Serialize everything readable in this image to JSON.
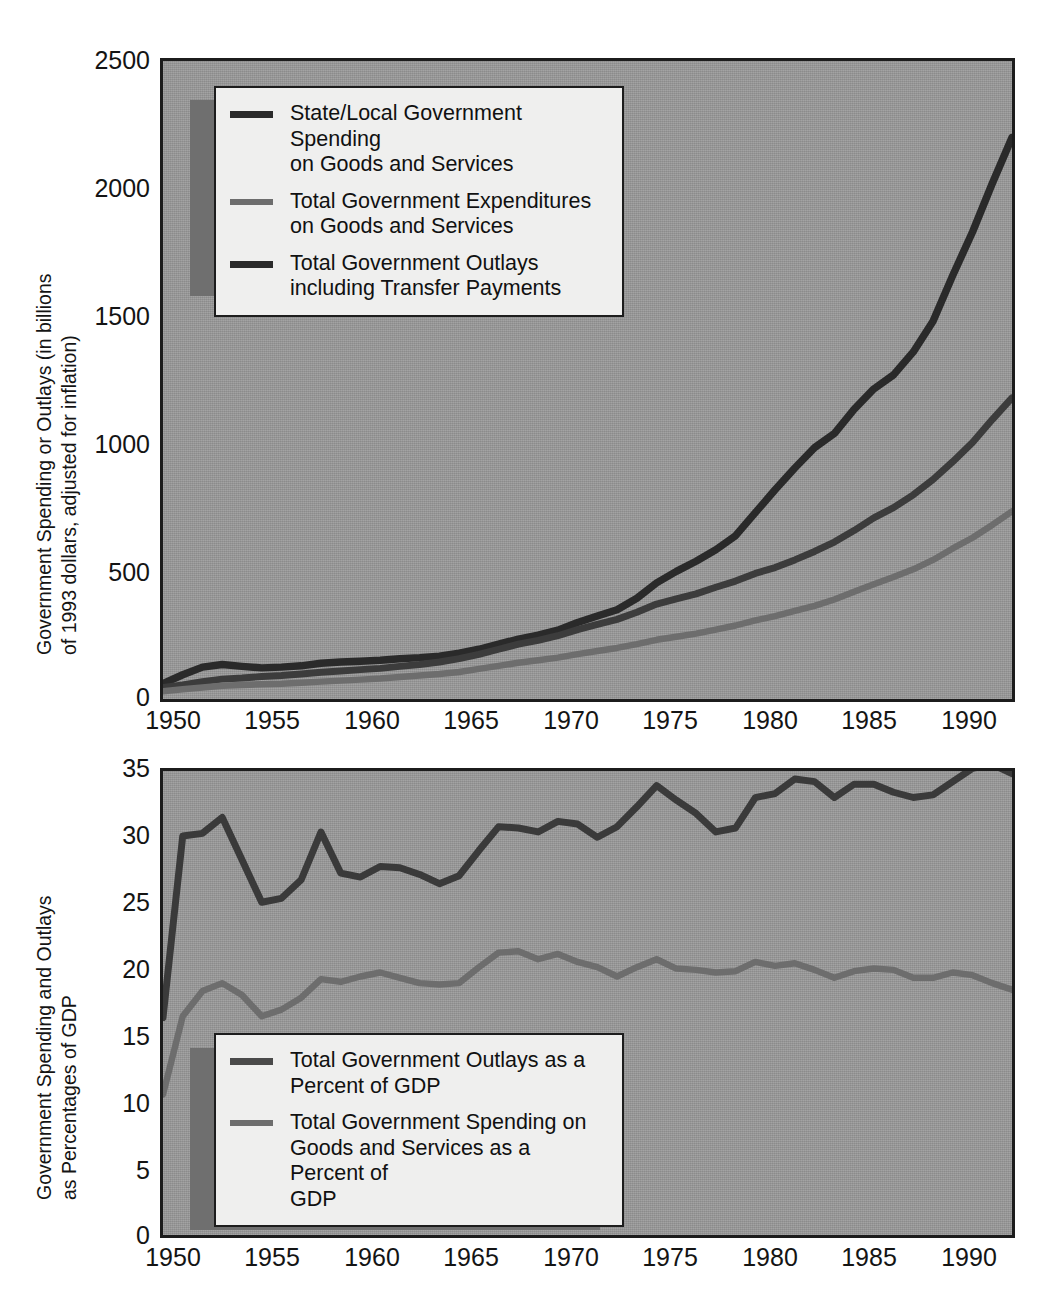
{
  "figure": {
    "background_color": "#ffffff",
    "plot_face_color": "#9a9a9a",
    "axis_color": "#1c1c1c"
  },
  "chart_data": [
    {
      "type": "line",
      "panel": "top",
      "title": "",
      "xlabel": "",
      "ylabel": "Government Spending or Outlays (in billions\nof 1993 dollars, adjusted for inflation)",
      "xlim": [
        1950,
        1993
      ],
      "ylim": [
        0,
        2500
      ],
      "xticks": [
        "1950",
        "1955",
        "1960",
        "1965",
        "1970",
        "1975",
        "1980",
        "1985",
        "1990"
      ],
      "xtick_values": [
        1950,
        1955,
        1960,
        1965,
        1970,
        1975,
        1980,
        1985,
        1990
      ],
      "yticks": [
        "0",
        "500",
        "1000",
        "1500",
        "2000",
        "2500"
      ],
      "ytick_values": [
        0,
        500,
        1000,
        1500,
        2000,
        2500
      ],
      "grid": false,
      "legend_position": "upper left",
      "x": [
        1950,
        1951,
        1952,
        1953,
        1954,
        1955,
        1956,
        1957,
        1958,
        1959,
        1960,
        1961,
        1962,
        1963,
        1964,
        1965,
        1966,
        1967,
        1968,
        1969,
        1970,
        1971,
        1972,
        1973,
        1974,
        1975,
        1976,
        1977,
        1978,
        1979,
        1980,
        1981,
        1982,
        1983,
        1984,
        1985,
        1986,
        1987,
        1988,
        1989,
        1990,
        1991,
        1992,
        1993
      ],
      "series": [
        {
          "name": "Total Government Outlays including Transfer Payments",
          "color": "#2a2a2a",
          "values": [
            60,
            95,
            125,
            135,
            128,
            122,
            125,
            130,
            140,
            145,
            148,
            152,
            158,
            162,
            168,
            180,
            195,
            215,
            235,
            250,
            270,
            300,
            325,
            350,
            395,
            455,
            500,
            540,
            585,
            640,
            730,
            820,
            905,
            985,
            1040,
            1135,
            1215,
            1270,
            1360,
            1480,
            1660,
            1830,
            2020,
            2200
          ]
        },
        {
          "name": "State/Local Government Spending on Goods and Services",
          "color": "#3c3c3c",
          "values": [
            45,
            55,
            68,
            78,
            82,
            88,
            92,
            98,
            105,
            110,
            115,
            120,
            128,
            135,
            145,
            158,
            175,
            195,
            215,
            230,
            248,
            272,
            292,
            312,
            340,
            372,
            392,
            412,
            438,
            462,
            492,
            515,
            545,
            578,
            615,
            660,
            710,
            750,
            800,
            860,
            930,
            1005,
            1095,
            1180
          ]
        },
        {
          "name": "Total Government Expenditures on Goods and Services",
          "color": "#6d6d6d",
          "values": [
            30,
            38,
            45,
            52,
            55,
            58,
            60,
            64,
            68,
            72,
            76,
            80,
            86,
            92,
            98,
            106,
            118,
            130,
            142,
            152,
            162,
            176,
            188,
            200,
            215,
            232,
            244,
            256,
            272,
            288,
            308,
            325,
            345,
            365,
            390,
            420,
            450,
            478,
            508,
            545,
            590,
            632,
            682,
            735
          ]
        }
      ]
    },
    {
      "type": "line",
      "panel": "bottom",
      "title": "",
      "xlabel": "",
      "ylabel": "Government Spending and Outlays\nas Percentages of GDP",
      "xlim": [
        1950,
        1993
      ],
      "ylim": [
        0,
        35
      ],
      "xticks": [
        "1950",
        "1955",
        "1960",
        "1965",
        "1970",
        "1975",
        "1980",
        "1985",
        "1990"
      ],
      "xtick_values": [
        1950,
        1955,
        1960,
        1965,
        1970,
        1975,
        1980,
        1985,
        1990
      ],
      "yticks": [
        "0",
        "5",
        "10",
        "15",
        "20",
        "25",
        "30",
        "35"
      ],
      "ytick_values": [
        0,
        5,
        10,
        15,
        20,
        25,
        30,
        35
      ],
      "grid": false,
      "legend_position": "lower left",
      "x": [
        1950,
        1951,
        1952,
        1953,
        1954,
        1955,
        1956,
        1957,
        1958,
        1959,
        1960,
        1961,
        1962,
        1963,
        1964,
        1965,
        1966,
        1967,
        1968,
        1969,
        1970,
        1971,
        1972,
        1973,
        1974,
        1975,
        1976,
        1977,
        1978,
        1979,
        1980,
        1981,
        1982,
        1983,
        1984,
        1985,
        1986,
        1987,
        1988,
        1989,
        1990,
        1991,
        1992,
        1993
      ],
      "series": [
        {
          "name": "Total Government Outlays as a Percent of GDP",
          "color": "#3a3a3a",
          "values": [
            16.4,
            30.1,
            30.3,
            31.5,
            28.3,
            25.1,
            25.4,
            26.8,
            30.4,
            27.3,
            27.0,
            27.8,
            27.7,
            27.2,
            26.5,
            27.1,
            29.0,
            30.8,
            30.7,
            30.4,
            31.2,
            31.0,
            30.0,
            30.8,
            32.3,
            33.9,
            32.8,
            31.8,
            30.4,
            30.7,
            33.0,
            33.3,
            34.4,
            34.2,
            33.0,
            34.0,
            34.0,
            33.4,
            33.0,
            33.2,
            34.2,
            35.2,
            35.5,
            34.8
          ]
        },
        {
          "name": "Total Government Spending on Goods and Services as a Percent of GDP",
          "color": "#6d6d6d",
          "values": [
            10.6,
            16.5,
            18.4,
            19.0,
            18.1,
            16.5,
            17.0,
            17.9,
            19.3,
            19.1,
            19.5,
            19.8,
            19.4,
            19.0,
            18.9,
            19.0,
            20.2,
            21.3,
            21.4,
            20.8,
            21.2,
            20.6,
            20.2,
            19.5,
            20.2,
            20.8,
            20.1,
            20.0,
            19.8,
            19.9,
            20.6,
            20.3,
            20.5,
            20.0,
            19.4,
            19.9,
            20.1,
            20.0,
            19.4,
            19.4,
            19.8,
            19.6,
            19.0,
            18.5
          ]
        }
      ]
    }
  ],
  "top_chart": {
    "legend": {
      "items": [
        {
          "label": "State/Local Government Spending\non Goods and Services",
          "swatch": "dark"
        },
        {
          "label": "Total Government Expenditures\non Goods and Services",
          "swatch": "light"
        },
        {
          "label": "Total Government Outlays\nincluding Transfer Payments",
          "swatch": "dark"
        }
      ]
    }
  },
  "bottom_chart": {
    "legend": {
      "items": [
        {
          "label": "Total Government Outlays as a\nPercent of GDP",
          "swatch": "mid"
        },
        {
          "label": "Total Government Spending on\nGoods and Services as a Percent of\nGDP",
          "swatch": "light"
        }
      ]
    }
  }
}
